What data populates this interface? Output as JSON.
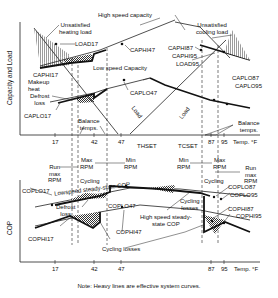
{
  "figure": {
    "top_panel": {
      "y_axis_label": "Capacity and Load",
      "x_axis_label": "Temp. °F",
      "x_ticks": [
        "17",
        "42",
        "47",
        "87",
        "95"
      ],
      "x_markers": [
        "THSET",
        "TCSET"
      ],
      "annotations": {
        "high_speed_capacity": "High speed capacity",
        "unsatisfied_heating_line1": "Unsatisfied",
        "unsatisfied_heating_line2": "heating load",
        "unsatisfied_cooling_line1": "Unsatisfied",
        "unsatisfied_cooling_line2": "cooling load",
        "load17": "LOAD17",
        "caphi47": "CAPHI47",
        "caphi87": "CAPHI87",
        "caphi95": "CAPHI95",
        "load95": "LOAD95",
        "caphi17": "CAPHI17",
        "makeup_line1": "Makeup",
        "makeup_line2": "heat",
        "low_speed_capacity": "Low speed Capacity",
        "caplo47": "CAPLO47",
        "caplo87": "CAPLO87",
        "caplo95": "CAPLO95",
        "defrost_line1": "Defrost",
        "defrost_line2": "loss",
        "caplo17": "CAPLO17",
        "balance_left_line1": "Balance",
        "balance_left_line2": "temps.",
        "balance_right_line1": "Balance",
        "balance_right_line2": "temps.",
        "load_left": "Load",
        "load_right": "Load"
      }
    },
    "middle_labels": {
      "run_max_left": [
        "Run",
        "max",
        "RPM"
      ],
      "max_rpm_left": [
        "Max",
        "RPM"
      ],
      "min_rpm_left": [
        "Min",
        "RPM"
      ],
      "min_rpm_right": [
        "Min",
        "RPM"
      ],
      "max_rpm_right": [
        "Max",
        "RPM"
      ],
      "run_max_right": [
        "Run",
        "max",
        "RPM"
      ],
      "cycling_left": "Cycling",
      "cycling_right": "Cycling"
    },
    "bottom_panel": {
      "y_axis_label": "COP",
      "x_axis_label": "Temp. °F",
      "x_ticks": [
        "17",
        "42",
        "47",
        "87",
        "95"
      ],
      "annotations": {
        "coplo17": "COPLO17",
        "lowspeed_cop": "Lowspeed steady-state COP",
        "defrost_line1": "Defrost",
        "defrost_line2": "loss",
        "coplo47": "COPLO47",
        "coplo87": "COPLO87",
        "coplo95": "COPLO95",
        "cycling_losses_right_line1": "Cycling",
        "cycling_losses_right_line2": "losses",
        "high_speed_cop_line1": "High speed steady-",
        "high_speed_cop_line2": "state COP",
        "cophi87": "COPHI87",
        "cophi95": "COPHI95",
        "cophi17": "COPHI17",
        "cophi47": "COPHI47",
        "cycling_losses_bottom": "Cycling losses"
      }
    },
    "note": "Note:  Heavy lines are effective system curves."
  }
}
